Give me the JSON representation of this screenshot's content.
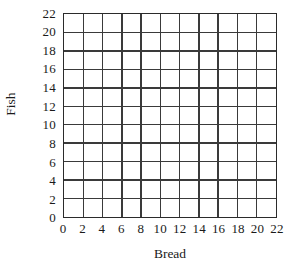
{
  "chart_data": {
    "type": "scatter",
    "title": "",
    "subtitle": "",
    "xlabel": "Bread",
    "ylabel": "Fish",
    "xlim": [
      0,
      22
    ],
    "ylim": [
      0,
      22
    ],
    "xticks": [
      0,
      2,
      4,
      6,
      8,
      10,
      12,
      14,
      16,
      18,
      20,
      22
    ],
    "yticks": [
      0,
      2,
      4,
      6,
      8,
      10,
      12,
      14,
      16,
      18,
      20,
      22
    ],
    "xtick_labels": [
      "0",
      "2",
      "4",
      "6",
      "8",
      "10",
      "12",
      "14",
      "16",
      "18",
      "20",
      "22"
    ],
    "ytick_labels": [
      "0",
      "2",
      "4",
      "6",
      "8",
      "10",
      "12",
      "14",
      "16",
      "18",
      "20",
      "22"
    ],
    "grid": true,
    "grid_step": 2,
    "grid_columns": 11,
    "grid_rows": 11,
    "legend": null,
    "legend_position": "none",
    "annotations": [],
    "series": [],
    "x": [],
    "values": [],
    "note": "Empty coordinate grid; no data points, lines, or markers are plotted.",
    "colors": {
      "background": "#ffffff",
      "grid_line": "#3a3a3a",
      "axis_frame": "#2b2b2b",
      "text": "#1a1a1a"
    }
  }
}
